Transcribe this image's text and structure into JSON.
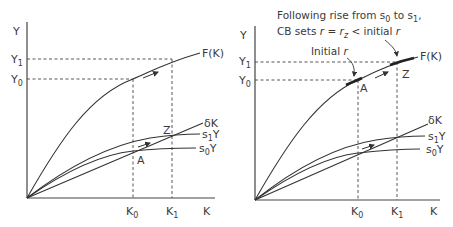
{
  "left_panel": {
    "y_axis_label": "Y",
    "x_axis_label": "K",
    "y_ticks": [
      {
        "main": "Y",
        "sub": "1"
      },
      {
        "main": "Y",
        "sub": "0"
      }
    ],
    "x_ticks": [
      {
        "main": "K",
        "sub": "0"
      },
      {
        "main": "K",
        "sub": "1"
      }
    ],
    "curves": {
      "production": "F(K)",
      "depreciation": "δK",
      "savings_high": {
        "main": "s",
        "sub": "1",
        "tail": "Y"
      },
      "savings_low": {
        "main": "s",
        "sub": "0",
        "tail": "Y"
      }
    },
    "points": {
      "initial": "A",
      "new": "Z"
    }
  },
  "right_panel": {
    "y_axis_label": "Y",
    "x_axis_label": "K",
    "y_ticks": [
      {
        "main": "Y",
        "sub": "1"
      },
      {
        "main": "Y",
        "sub": "0"
      }
    ],
    "x_ticks": [
      {
        "main": "K",
        "sub": "0"
      },
      {
        "main": "K",
        "sub": "1"
      }
    ],
    "curves": {
      "production": "F(K)",
      "depreciation": "δK",
      "savings_high": {
        "main": "s",
        "sub": "1",
        "tail": "Y"
      },
      "savings_low": {
        "main": "s",
        "sub": "0",
        "tail": "Y"
      }
    },
    "points": {
      "initial": "A",
      "new": "Z"
    },
    "annotations": {
      "top_line1_pre": "Following rise from s",
      "top_line1_sub0": "0",
      "top_line1_mid": " to s",
      "top_line1_sub1": "1",
      "top_line1_post": ",",
      "top_line2_pre": "CB sets ",
      "top_line2_r": "r",
      "top_line2_eq": " = ",
      "top_line2_rz": "r",
      "top_line2_rz_sub": "z",
      "top_line2_post": " < initial ",
      "top_line2_r2": "r",
      "initial_r_pre": "Initial ",
      "initial_r_var": "r"
    }
  }
}
